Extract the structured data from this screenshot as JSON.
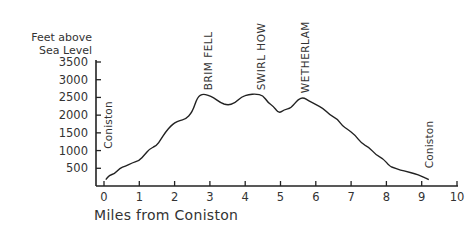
{
  "chart_data": {
    "type": "line",
    "title": "",
    "xlabel": "Miles from Coniston",
    "ylabel": "Feet above Sea Level",
    "ylabel_lines": [
      "Feet above",
      "Sea Level"
    ],
    "xlim": [
      0,
      10
    ],
    "ylim": [
      0,
      3500
    ],
    "x_ticks": [
      0,
      1,
      2,
      3,
      4,
      5,
      6,
      7,
      8,
      9,
      10
    ],
    "y_ticks": [
      500,
      1000,
      1500,
      2000,
      2500,
      3000,
      3500
    ],
    "grid": false,
    "legend": null,
    "series": [
      {
        "name": "Elevation profile",
        "x": [
          0.05,
          0.15,
          0.3,
          0.45,
          0.6,
          0.8,
          1.0,
          1.15,
          1.3,
          1.5,
          1.6,
          1.75,
          1.9,
          2.0,
          2.15,
          2.3,
          2.5,
          2.65,
          2.8,
          2.95,
          3.1,
          3.3,
          3.5,
          3.7,
          3.9,
          4.1,
          4.3,
          4.5,
          4.65,
          4.8,
          4.95,
          5.1,
          5.3,
          5.5,
          5.65,
          5.8,
          6.0,
          6.2,
          6.4,
          6.6,
          6.75,
          6.9,
          7.1,
          7.3,
          7.5,
          7.7,
          7.9,
          8.1,
          8.2,
          8.4,
          8.6,
          8.8,
          9.0,
          9.2
        ],
        "y": [
          180,
          300,
          350,
          500,
          560,
          650,
          720,
          880,
          1050,
          1150,
          1300,
          1530,
          1700,
          1780,
          1850,
          1880,
          2080,
          2520,
          2600,
          2560,
          2500,
          2350,
          2280,
          2330,
          2520,
          2580,
          2600,
          2560,
          2350,
          2250,
          2050,
          2150,
          2200,
          2450,
          2500,
          2400,
          2300,
          2200,
          2000,
          1900,
          1700,
          1600,
          1450,
          1200,
          1100,
          880,
          780,
          550,
          520,
          450,
          400,
          350,
          280,
          180
        ]
      }
    ],
    "annotations": [
      {
        "text": "Coniston",
        "x": 0.1,
        "y_anchor": 1050,
        "rotation": -90
      },
      {
        "text": "BRIM FELL",
        "x": 2.95,
        "y_anchor": 2700,
        "rotation": -90
      },
      {
        "text": "SWIRL HOW",
        "x": 4.45,
        "y_anchor": 2700,
        "rotation": -90
      },
      {
        "text": "WETHERLAM",
        "x": 5.7,
        "y_anchor": 2620,
        "rotation": -90
      },
      {
        "text": "Coniston",
        "x": 9.2,
        "y_anchor": 500,
        "rotation": -90
      }
    ]
  },
  "colors": {
    "line": "#222222",
    "axis": "#222222",
    "text": "#333333"
  }
}
